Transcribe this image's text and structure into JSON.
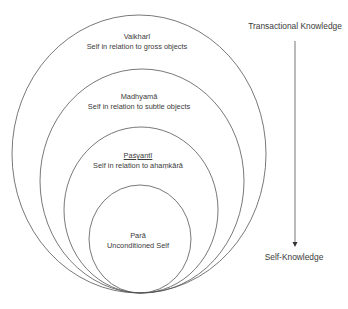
{
  "diagram": {
    "type": "nested-ellipses",
    "stroke_color": "#555555",
    "layers": [
      {
        "name": "Vaikharī",
        "description": "Self in relation to gross objects",
        "ellipse": {
          "cx": 139,
          "cy": 154,
          "rx": 127,
          "ry": 139
        }
      },
      {
        "name": "Madhyamā",
        "description": "Self in relation to subtle objects",
        "ellipse": {
          "cx": 142,
          "cy": 181,
          "rx": 102,
          "ry": 112
        }
      },
      {
        "name": "Paśyantī",
        "description": "Self in relation to ahaṃkārā",
        "ellipse": {
          "cx": 141,
          "cy": 210,
          "rx": 77,
          "ry": 83
        }
      },
      {
        "name": "Parā",
        "description": "Unconditioned Self",
        "ellipse": {
          "cx": 140,
          "cy": 239,
          "rx": 51,
          "ry": 54
        }
      }
    ],
    "axis": {
      "top_label": "Transactional Knowledge",
      "bottom_label": "Self-Knowledge",
      "direction": "downward"
    }
  }
}
